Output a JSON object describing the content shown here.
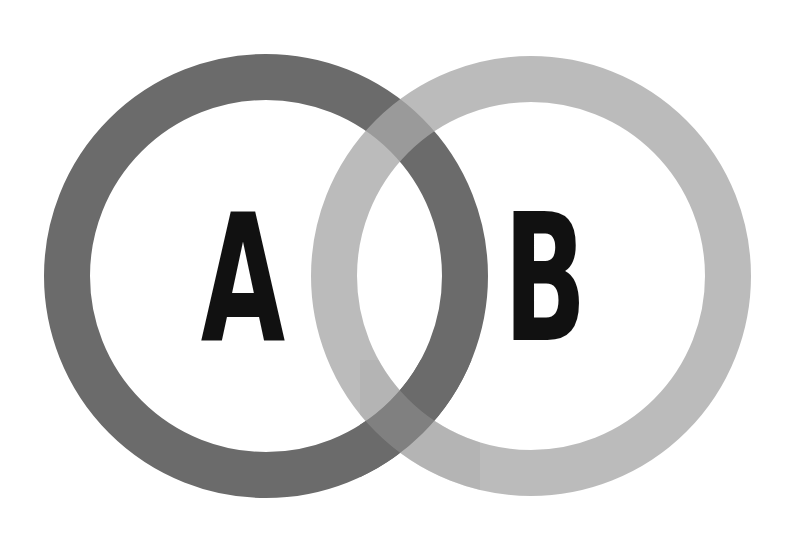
{
  "diagram": {
    "type": "venn",
    "sets": [
      {
        "id": "A",
        "label": "A",
        "ring_color": "#6b6b6b",
        "cx": 266,
        "cy": 276,
        "r": 199,
        "stroke_width": 46
      },
      {
        "id": "B",
        "label": "B",
        "ring_color": "#b3b3b3",
        "cx": 531,
        "cy": 276,
        "r": 197,
        "stroke_width": 46
      }
    ],
    "overlap_color": "#8e8e8e",
    "background": "#ffffff",
    "label_color": "#111111"
  }
}
